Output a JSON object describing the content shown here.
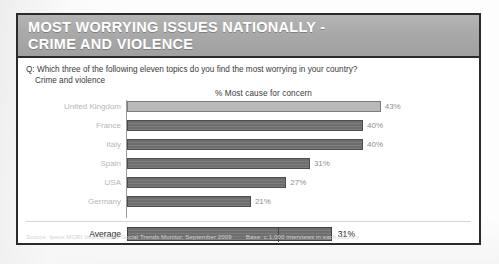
{
  "header": {
    "title": "MOST WORRYING ISSUES NATIONALLY -\nCRIME AND VIOLENCE"
  },
  "question": {
    "line1": "Q: Which three of the following eleven topics do you find the most worrying in your country?",
    "line2": "Crime and violence"
  },
  "source": {
    "text": "Source: Ipsos MORI International Social Trends Monitor, September 2009",
    "base": "Base: c.1,000 interviews in each country"
  },
  "colors": {
    "bar": "#6e6e6e",
    "bar_highlight": "#b9b9b9",
    "header_band": "#a9a9a9",
    "border": "#2b2b2b"
  },
  "chart_data": {
    "type": "bar",
    "orientation": "horizontal",
    "title": "% Most cause for concern",
    "xlabel": "",
    "ylabel": "",
    "xlim": [
      0,
      50
    ],
    "grid": false,
    "legend": null,
    "categories": [
      "United Kingdom",
      "France",
      "Italy",
      "Spain",
      "USA",
      "Germany"
    ],
    "values": [
      43,
      40,
      40,
      31,
      27,
      21
    ],
    "value_labels": [
      "43%",
      "40%",
      "40%",
      "31%",
      "27%",
      "21%"
    ],
    "highlight_category": "United Kingdom",
    "average": {
      "label": "Average",
      "value": 31,
      "value_label": "31%"
    }
  }
}
